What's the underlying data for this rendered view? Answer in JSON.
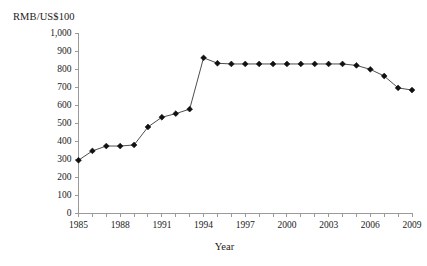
{
  "chart_data": {
    "type": "line",
    "title": "",
    "ylabel": "RMB/US$100",
    "xlabel": "Year",
    "ylim": [
      0,
      1000
    ],
    "ytick_step": 100,
    "ytick_labels": [
      "1,000",
      "900",
      "800",
      "700",
      "600",
      "500",
      "400",
      "300",
      "200",
      "100",
      "0"
    ],
    "xlim": [
      1985,
      2009
    ],
    "xtick_labels": [
      "1985",
      "1988",
      "1991",
      "1994",
      "1997",
      "2000",
      "2003",
      "2006",
      "2009"
    ],
    "xtick_label_step": 3,
    "xtick_minor_step": 1,
    "grid": false,
    "legend": "none",
    "marker": "diamond",
    "line_color": "#3a3a3a",
    "marker_color": "#111111",
    "axis_color": "#9a9a9a",
    "background_color": "#ffffff",
    "x": [
      1985,
      1986,
      1987,
      1988,
      1989,
      1990,
      1991,
      1992,
      1993,
      1994,
      1995,
      1996,
      1997,
      1998,
      1999,
      2000,
      2001,
      2002,
      2003,
      2004,
      2005,
      2006,
      2007,
      2008,
      2009
    ],
    "values": [
      293,
      345,
      372,
      372,
      378,
      478,
      532,
      552,
      577,
      862,
      832,
      828,
      828,
      828,
      828,
      828,
      828,
      828,
      828,
      828,
      820,
      798,
      761,
      695,
      683
    ],
    "series": [
      {
        "name": "RMB per US$100",
        "values": [
          293,
          345,
          372,
          372,
          378,
          478,
          532,
          552,
          577,
          862,
          832,
          828,
          828,
          828,
          828,
          828,
          828,
          828,
          828,
          828,
          820,
          798,
          761,
          695,
          683
        ]
      }
    ]
  }
}
